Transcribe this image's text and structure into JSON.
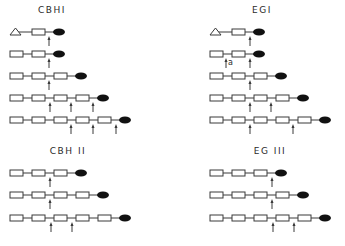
{
  "panels": [
    {
      "id": "cbh1",
      "title": "CBHI",
      "title_x": 52,
      "title_y": 5,
      "rows": [
        {
          "y": 32,
          "start_x": 10,
          "units": [
            "triangle",
            "box"
          ],
          "arrows": [
            {
              "x": 49
            }
          ]
        },
        {
          "y": 54,
          "start_x": 10,
          "units": [
            "box",
            "box"
          ],
          "arrows": [
            {
              "x": 49
            }
          ]
        },
        {
          "y": 76,
          "start_x": 10,
          "units": [
            "box",
            "box",
            "box"
          ],
          "arrows": [
            {
              "x": 49
            }
          ]
        },
        {
          "y": 98,
          "start_x": 10,
          "units": [
            "box",
            "box",
            "box",
            "box"
          ],
          "arrows": [
            {
              "x": 50
            },
            {
              "x": 71
            },
            {
              "x": 93
            }
          ]
        },
        {
          "y": 120,
          "start_x": 10,
          "units": [
            "box",
            "box",
            "box",
            "box",
            "box"
          ],
          "arrows": [
            {
              "x": 71
            },
            {
              "x": 93
            },
            {
              "x": 116
            }
          ]
        }
      ]
    },
    {
      "id": "eg1",
      "title": "EGI",
      "title_x": 262,
      "title_y": 5,
      "rows": [
        {
          "y": 32,
          "start_x": 210,
          "units": [
            "triangle",
            "box"
          ],
          "arrows": [
            {
              "x": 250
            }
          ]
        },
        {
          "y": 54,
          "start_x": 210,
          "units": [
            "box",
            "box"
          ],
          "arrows": [
            {
              "x": 226,
              "label": "a"
            },
            {
              "x": 250
            }
          ]
        },
        {
          "y": 76,
          "start_x": 210,
          "units": [
            "box",
            "box",
            "box"
          ],
          "arrows": [
            {
              "x": 250
            }
          ]
        },
        {
          "y": 98,
          "start_x": 210,
          "units": [
            "box",
            "box",
            "box",
            "box"
          ],
          "arrows": [
            {
              "x": 250
            },
            {
              "x": 271
            }
          ]
        },
        {
          "y": 120,
          "start_x": 210,
          "units": [
            "box",
            "box",
            "box",
            "box",
            "box"
          ],
          "arrows": [
            {
              "x": 250
            },
            {
              "x": 293
            }
          ]
        }
      ]
    },
    {
      "id": "cbh2",
      "title": "CBH II",
      "title_x": 68,
      "title_y": 146,
      "rows": [
        {
          "y": 173,
          "start_x": 10,
          "units": [
            "box",
            "box",
            "box"
          ],
          "arrows": [
            {
              "x": 50
            }
          ]
        },
        {
          "y": 195,
          "start_x": 10,
          "units": [
            "box",
            "box",
            "box",
            "box"
          ],
          "arrows": [
            {
              "x": 50
            }
          ]
        },
        {
          "y": 218,
          "start_x": 10,
          "units": [
            "box",
            "box",
            "box",
            "box",
            "box"
          ],
          "arrows": [
            {
              "x": 51
            },
            {
              "x": 72
            }
          ]
        }
      ]
    },
    {
      "id": "eg3",
      "title": "EG III",
      "title_x": 270,
      "title_y": 146,
      "rows": [
        {
          "y": 173,
          "start_x": 210,
          "units": [
            "box",
            "box",
            "box"
          ],
          "arrows": [
            {
              "x": 272
            }
          ]
        },
        {
          "y": 195,
          "start_x": 210,
          "units": [
            "box",
            "box",
            "box",
            "box"
          ],
          "arrows": [
            {
              "x": 272
            }
          ]
        },
        {
          "y": 218,
          "start_x": 210,
          "units": [
            "box",
            "box",
            "box",
            "box",
            "box"
          ],
          "arrows": [
            {
              "x": 273
            },
            {
              "x": 294
            }
          ]
        }
      ]
    }
  ],
  "style": {
    "stroke": "#3a3a3a",
    "fill_end": "#111111",
    "unit_width": 13,
    "unit_height": 6,
    "spacing": 22,
    "ellipse_rx": 6,
    "ellipse_ry": 3.5
  }
}
